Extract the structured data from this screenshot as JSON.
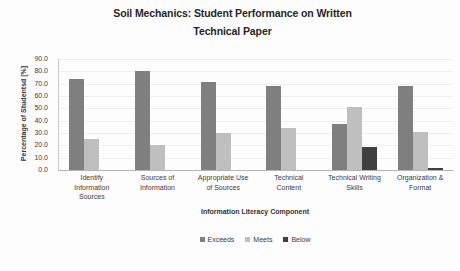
{
  "chart_data": {
    "type": "bar",
    "title": "Soil Mechanics: Student Performance on Written Technical Paper",
    "title_line1": "Soil Mechanics: Student Performance on Written",
    "title_line2": "Technical Paper",
    "xlabel": "Information Literacy Component",
    "ylabel": "Percentage of Studentsd [%]",
    "ylim": [
      0,
      90
    ],
    "ytick_labels": [
      "90.0",
      "80.0",
      "70.0",
      "60.0",
      "50.0",
      "40.0",
      "30.0",
      "20.0",
      "10.0",
      "0.0"
    ],
    "ytick_values": [
      90,
      80,
      70,
      60,
      50,
      40,
      30,
      20,
      10,
      0
    ],
    "grid": true,
    "legend_position": "bottom",
    "categories": [
      "Identify Information Sources",
      "Sources of Information",
      "Appropriate Use of Sources",
      "Technical Content",
      "Technical Writing Skills",
      "Organization & Format"
    ],
    "category_lines": [
      [
        "Identify",
        "Information",
        "Sources"
      ],
      [
        "Sources of",
        "Information"
      ],
      [
        "Appropriate Use",
        "of Sources"
      ],
      [
        "Technical",
        "Content"
      ],
      [
        "Technical Writing",
        "Skills"
      ],
      [
        "Organization &",
        "Format"
      ]
    ],
    "series": [
      {
        "name": "Exceeds",
        "color": "#7f7f7f",
        "values": [
          74.0,
          80.0,
          71.5,
          68.5,
          37.0,
          68.5
        ]
      },
      {
        "name": "Meets",
        "color": "#bfbfbf",
        "values": [
          25.0,
          20.0,
          30.0,
          34.0,
          51.0,
          31.0
        ]
      },
      {
        "name": "Below",
        "color": "#3f3f3f",
        "values": [
          0.0,
          0.0,
          0.0,
          0.0,
          19.0,
          2.0
        ]
      }
    ]
  }
}
